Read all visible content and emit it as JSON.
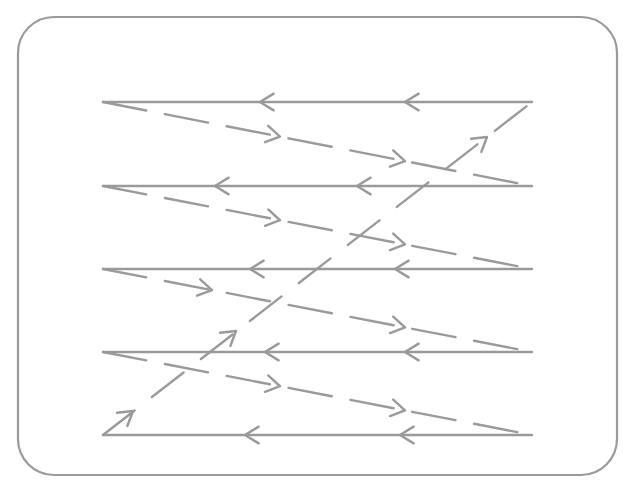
{
  "diagram": {
    "title": "Raster scan pattern",
    "colors": {
      "stroke": "#9a9a9a",
      "frame": "#9a9a9a",
      "background": "#ffffff"
    },
    "frame": {
      "x": 18,
      "y": 17,
      "width": 599,
      "height": 458,
      "radius": 36
    },
    "scan_lines": [
      {
        "y": 102,
        "x_start": 532,
        "x_end": 103,
        "direction": "left",
        "arrows_x": [
          260,
          405
        ]
      },
      {
        "y": 186,
        "x_start": 532,
        "x_end": 103,
        "direction": "left",
        "arrows_x": [
          215,
          357
        ]
      },
      {
        "y": 269,
        "x_start": 532,
        "x_end": 103,
        "direction": "left",
        "arrows_x": [
          250,
          395
        ]
      },
      {
        "y": 352,
        "x_start": 532,
        "x_end": 103,
        "direction": "left",
        "arrows_x": [
          265,
          405
        ]
      },
      {
        "y": 435,
        "x_start": 532,
        "x_end": 103,
        "direction": "left",
        "arrows_x": [
          245,
          400
        ]
      }
    ],
    "retrace_lines": [
      {
        "from": [
          103,
          102
        ],
        "to": [
          532,
          186
        ],
        "style": "dashed",
        "arrows_x": [
          280,
          405
        ]
      },
      {
        "from": [
          103,
          186
        ],
        "to": [
          532,
          269
        ],
        "style": "dashed",
        "arrows_x": [
          280,
          405
        ]
      },
      {
        "from": [
          103,
          269
        ],
        "to": [
          532,
          352
        ],
        "style": "dashed",
        "arrows_x": [
          212,
          405
        ]
      },
      {
        "from": [
          103,
          352
        ],
        "to": [
          532,
          435
        ],
        "style": "dashed",
        "arrows_x": [
          280,
          405
        ]
      }
    ],
    "vertical_retrace": {
      "from": [
        103,
        435
      ],
      "to": [
        532,
        102
      ],
      "style": "dashed",
      "arrows_at": [
        [
          133,
          411
        ],
        [
          236,
          331
        ],
        [
          487,
          137
        ]
      ]
    }
  }
}
